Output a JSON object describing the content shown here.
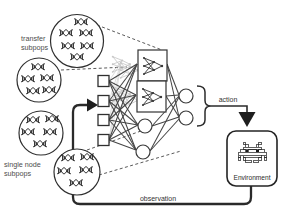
{
  "figure": {
    "labels": {
      "transfer_subpops": {
        "line1": "transfer",
        "line2": "subpops"
      },
      "single_node_subpops": {
        "line1": "single node",
        "line2": "subpops"
      },
      "action": "action",
      "observation": "observation",
      "environment": "Environment"
    },
    "icons": {
      "population_glyph": "dna-helix-icon",
      "hidden_unit_glyph": "mini-network-icon",
      "environment_glyph": "space-invader-icon"
    },
    "colors": {
      "ink": "#2f2f2f",
      "edge": "#4a4a4a",
      "ghost": "#b5b5b5",
      "background": "#ffffff"
    },
    "structure": {
      "transfer_subpop_circles": 2,
      "single_node_subpop_circles": 2,
      "input_nodes": 4,
      "hidden_subnetwork_boxes": 2,
      "hidden_nodes": 2,
      "output_nodes": 2
    }
  }
}
